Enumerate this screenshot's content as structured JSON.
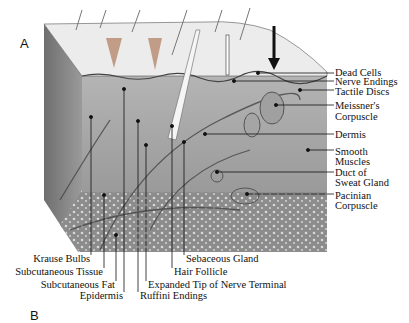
{
  "figure": {
    "panel_label": "A",
    "next_panel_label": "B",
    "arrow": "pressure-arrow"
  },
  "labels_right": [
    {
      "text": "Dead Cells"
    },
    {
      "text": "Nerve Endings"
    },
    {
      "text": "Tactile Discs"
    },
    {
      "text": "Meissner's",
      "text2": "Corpuscle"
    },
    {
      "text": "Dermis"
    },
    {
      "text": "Smooth",
      "text2": "Muscles"
    },
    {
      "text": "Duct of",
      "text2": "Sweat Gland"
    },
    {
      "text": "Pacinian",
      "text2": "Corpuscle"
    }
  ],
  "labels_bottom": [
    {
      "text": "Krause Bulbs"
    },
    {
      "text": "Subcutaneous Tissue"
    },
    {
      "text": "Subcutaneous Fat"
    },
    {
      "text": "Epidermis"
    },
    {
      "text": "Ruffini Endings"
    },
    {
      "text": "Expanded Tip of Nerve Terminal"
    },
    {
      "text": "Hair Follicle"
    },
    {
      "text": "Sebaceous Gland"
    }
  ],
  "colors": {
    "epidermis": "#e9e9e9",
    "dermis": "#a9a9a9",
    "subcutaneous": "#8f8f8f",
    "side_face": "#7a7a7a",
    "line": "#111111"
  }
}
